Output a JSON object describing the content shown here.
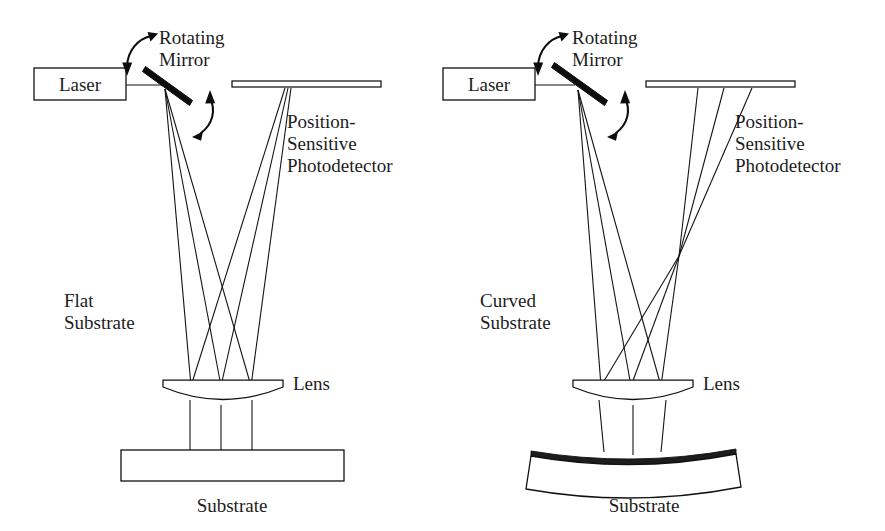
{
  "figure": {
    "background_color": "#ffffff",
    "ink_color": "#111111",
    "panels": [
      {
        "id": "left-panel",
        "name": "flat-substrate-panel",
        "substrate_type": "Flat",
        "labels": {
          "laser": "Laser",
          "rotating_mirror_line1": "Rotating",
          "rotating_mirror_line2": "Mirror",
          "detector_line1": "Position-",
          "detector_line2": "Sensitive",
          "detector_line3": "Photodetector",
          "substrate_kind_line1": "Flat",
          "substrate_kind_line2": "Substrate",
          "lens": "Lens",
          "substrate": "Substrate"
        }
      },
      {
        "id": "right-panel",
        "name": "curved-substrate-panel",
        "substrate_type": "Curved",
        "labels": {
          "laser": "Laser",
          "rotating_mirror_line1": "Rotating",
          "rotating_mirror_line2": "Mirror",
          "detector_line1": "Position-",
          "detector_line2": "Sensitive",
          "detector_line3": "Photodetector",
          "substrate_kind_line1": "Curved",
          "substrate_kind_line2": "Substrate",
          "lens": "Lens",
          "substrate": "Substrate"
        }
      }
    ],
    "icons": {
      "rotation_arrow_upper": "curved-rotation-arrow-icon",
      "rotation_arrow_lower": "curved-rotation-arrow-icon"
    }
  }
}
